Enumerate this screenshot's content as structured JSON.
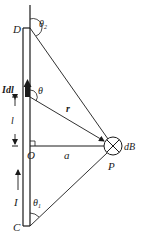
{
  "figure": {
    "labels": {
      "top_end": "D",
      "bottom_end": "C",
      "current_element": "Idl",
      "angle_element": "θ",
      "angle_top": "θ",
      "angle_top_sub": "2",
      "angle_bottom": "θ",
      "angle_bottom_sub": "1",
      "length": "l",
      "position_vector": "r",
      "foot_point": "O",
      "distance": "a",
      "field_point": "P",
      "field_element": "dB",
      "current": "I"
    },
    "colors": {
      "ink": "#1a1a1a",
      "background": "#ffffff"
    },
    "field_direction_symbol": "into-page (⊗)"
  }
}
